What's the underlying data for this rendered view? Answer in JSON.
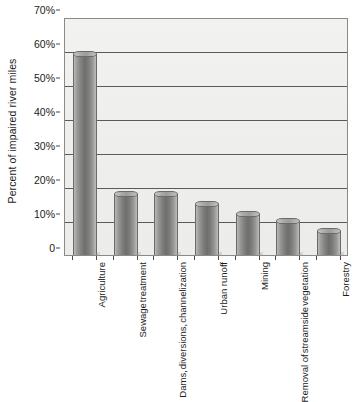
{
  "chart_data": {
    "type": "bar",
    "title": "",
    "xlabel": "",
    "ylabel": "Percent of impaired river miles",
    "ylim": [
      0,
      70
    ],
    "ytick_labels": [
      "70%",
      "60%",
      "50%",
      "40%",
      "30%",
      "20%",
      "10%",
      "0"
    ],
    "ytick_values": [
      70,
      60,
      50,
      40,
      30,
      20,
      10,
      0
    ],
    "grid": true,
    "legend": "none",
    "orientation": "vertical",
    "xtick_rotation_degrees": 90,
    "categories": [
      "Agriculture",
      "Sewage treatment",
      "Dams, diversions, channelization",
      "Urban runoff",
      "Mining",
      "Removal of streamside vegetation",
      "Forestry"
    ],
    "category_lines": [
      [
        "Agriculture"
      ],
      [
        "Sewage",
        "treatment"
      ],
      [
        "Dams,",
        "diversions,",
        "channelization"
      ],
      [
        "Urban runoff"
      ],
      [
        "Mining"
      ],
      [
        "Removal of",
        "streamside",
        "vegetation"
      ],
      [
        "Forestry"
      ]
    ],
    "values": [
      59,
      18,
      18,
      15,
      12,
      10,
      7
    ],
    "value_unit": "%",
    "colors": {
      "bar_fill_light": "#b9b9b7",
      "bar_fill_dark": "#6e6e6c",
      "bar_outline": "#6b6b69",
      "plot_background": "#efefed",
      "gridline": "#5a5a5a",
      "axis_line": "#4a4a4a",
      "text": "#1b1b1b"
    }
  }
}
